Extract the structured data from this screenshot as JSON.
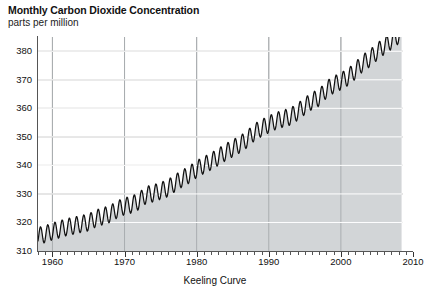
{
  "title": "Monthly Carbon Dioxide Concentration",
  "subtitle": "parts per million",
  "xlabel_text": "Keeling Curve",
  "chart_data": {
    "type": "line",
    "title": "Monthly Carbon Dioxide Concentration",
    "subtitle": "parts per million",
    "xlabel": "Keeling Curve",
    "ylabel": "parts per million",
    "xlim": [
      1958,
      2010
    ],
    "ylim": [
      310,
      385
    ],
    "xticks": [
      1960,
      1970,
      1980,
      1990,
      2000,
      2010
    ],
    "yticks": [
      310,
      320,
      330,
      340,
      350,
      360,
      370,
      380
    ],
    "grid": "horizontal gridlines at each y tick; vertical gridlines at each decade",
    "legend": "none",
    "fill": "area under curve shaded light gray down to 310",
    "line_color": "#111111",
    "fill_color": "#d2d5d7",
    "grid_color": "#9a9a9a",
    "series_name": "Monthly mean CO2 (Mauna Loa)",
    "seasonal_amplitude_ppm": 6,
    "annual_mean_x": [
      1958,
      1959,
      1960,
      1961,
      1962,
      1963,
      1964,
      1965,
      1966,
      1967,
      1968,
      1969,
      1970,
      1971,
      1972,
      1973,
      1974,
      1975,
      1976,
      1977,
      1978,
      1979,
      1980,
      1981,
      1982,
      1983,
      1984,
      1985,
      1986,
      1987,
      1988,
      1989,
      1990,
      1991,
      1992,
      1993,
      1994,
      1995,
      1996,
      1997,
      1998,
      1999,
      2000,
      2001,
      2002,
      2003,
      2004,
      2005,
      2006,
      2007,
      2008
    ],
    "annual_mean_y": [
      315.3,
      315.9,
      316.9,
      317.6,
      318.4,
      318.9,
      319.5,
      320.0,
      321.4,
      322.2,
      323.0,
      324.6,
      325.7,
      326.3,
      327.5,
      329.7,
      330.2,
      331.1,
      332.0,
      333.8,
      335.4,
      336.8,
      338.7,
      340.1,
      341.4,
      343.0,
      344.6,
      346.0,
      347.4,
      349.2,
      351.6,
      353.1,
      354.4,
      355.6,
      356.4,
      357.1,
      358.8,
      360.8,
      362.6,
      363.8,
      366.6,
      368.3,
      369.5,
      371.0,
      373.2,
      375.8,
      377.5,
      379.8,
      381.9,
      383.7,
      385.6
    ],
    "annotations": []
  },
  "ticks": {
    "y": [
      {
        "value": "380"
      },
      {
        "value": "370"
      },
      {
        "value": "360"
      },
      {
        "value": "350"
      },
      {
        "value": "340"
      },
      {
        "value": "330"
      },
      {
        "value": "320"
      },
      {
        "value": "310"
      }
    ],
    "x": [
      {
        "value": "1960"
      },
      {
        "value": "1970"
      },
      {
        "value": "1980"
      },
      {
        "value": "1990"
      },
      {
        "value": "2000"
      },
      {
        "value": "2010"
      }
    ]
  }
}
